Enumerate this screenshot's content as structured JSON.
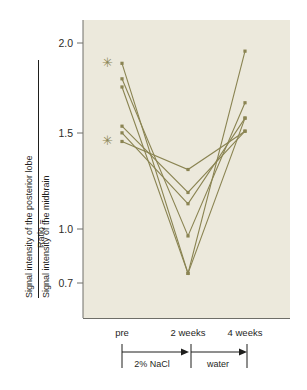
{
  "figure": {
    "background_color": "#ffffff",
    "plot_background_color": "#ece9dc",
    "series_color": "#8a8452",
    "axis_color": "#6e6e68",
    "text_color": "#1f1f1d"
  },
  "axis": {
    "y_ticks": [
      "2.0",
      "1.5",
      "1.0",
      "0.7"
    ],
    "y_label_prefix": "Ratio =",
    "y_label_numerator": "Signal intensity of the posterior lobe",
    "y_label_denominator": "Signal intensity of the midbrain",
    "x_categories": [
      "pre",
      "2 weeks",
      "4 weeks"
    ]
  },
  "annotations": {
    "phase_1": "2% NaCl",
    "phase_2": "water",
    "asterisk_glyph": "✳",
    "asterisk_count": 2
  },
  "chart_data": {
    "type": "line",
    "title": "",
    "subtitle": "",
    "xlabel": "",
    "ylabel": "Ratio = Signal intensity of the posterior lobe / Signal intensity of the midbrain",
    "categories": [
      "pre",
      "2 weeks",
      "4 weeks"
    ],
    "ylim": [
      0.6,
      2.1
    ],
    "yticks": [
      2.0,
      1.5,
      1.0,
      0.7
    ],
    "grid": false,
    "legend": "none",
    "y_scale": "log",
    "series": [
      {
        "name": "subject-1",
        "values": [
          1.83,
          0.73,
          1.93
        ],
        "marked": true
      },
      {
        "name": "subject-2",
        "values": [
          1.71,
          0.86,
          1.54
        ],
        "marked": false
      },
      {
        "name": "subject-3",
        "values": [
          1.65,
          0.73,
          1.44
        ],
        "marked": false
      },
      {
        "name": "subject-4",
        "values": [
          1.39,
          1.04,
          1.36
        ],
        "marked": false
      },
      {
        "name": "subject-5",
        "values": [
          1.35,
          0.99,
          1.44
        ],
        "marked": false
      },
      {
        "name": "subject-6",
        "values": [
          1.3,
          1.15,
          1.36
        ],
        "marked": true
      }
    ],
    "annotations": [
      {
        "text": "2% NaCl",
        "span": [
          "pre",
          "2 weeks"
        ]
      },
      {
        "text": "water",
        "span": [
          "2 weeks",
          "4 weeks"
        ]
      },
      {
        "text": "✳",
        "at": [
          "pre",
          1.83
        ]
      },
      {
        "text": "✳",
        "at": [
          "pre",
          1.3
        ]
      }
    ]
  }
}
